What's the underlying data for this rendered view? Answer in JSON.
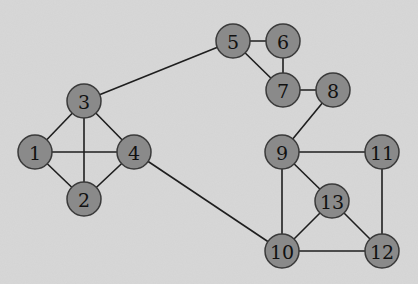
{
  "graph": {
    "title": "",
    "colors": {
      "background": "#d8d8d8",
      "node_fill": "#8a8a8a",
      "node_stroke": "#3a3a3a",
      "edge": "#1e1e1e",
      "label": "#111111"
    },
    "node_radius": 17,
    "nodes": [
      {
        "id": "1",
        "label": "1",
        "x": 35,
        "y": 152
      },
      {
        "id": "2",
        "label": "2",
        "x": 84,
        "y": 199
      },
      {
        "id": "3",
        "label": "3",
        "x": 84,
        "y": 101
      },
      {
        "id": "4",
        "label": "4",
        "x": 134,
        "y": 152
      },
      {
        "id": "5",
        "label": "5",
        "x": 233,
        "y": 41
      },
      {
        "id": "6",
        "label": "6",
        "x": 283,
        "y": 41
      },
      {
        "id": "7",
        "label": "7",
        "x": 283,
        "y": 90
      },
      {
        "id": "8",
        "label": "8",
        "x": 333,
        "y": 90
      },
      {
        "id": "9",
        "label": "9",
        "x": 282,
        "y": 152
      },
      {
        "id": "10",
        "label": "10",
        "x": 282,
        "y": 251
      },
      {
        "id": "11",
        "label": "11",
        "x": 382,
        "y": 152
      },
      {
        "id": "12",
        "label": "12",
        "x": 382,
        "y": 251
      },
      {
        "id": "13",
        "label": "13",
        "x": 332,
        "y": 201
      }
    ],
    "edges": [
      [
        "1",
        "2"
      ],
      [
        "1",
        "3"
      ],
      [
        "1",
        "4"
      ],
      [
        "2",
        "3"
      ],
      [
        "2",
        "4"
      ],
      [
        "3",
        "4"
      ],
      [
        "3",
        "5"
      ],
      [
        "4",
        "10"
      ],
      [
        "5",
        "6"
      ],
      [
        "5",
        "7"
      ],
      [
        "6",
        "7"
      ],
      [
        "7",
        "8"
      ],
      [
        "8",
        "9"
      ],
      [
        "9",
        "10"
      ],
      [
        "9",
        "11"
      ],
      [
        "9",
        "13"
      ],
      [
        "10",
        "12"
      ],
      [
        "10",
        "13"
      ],
      [
        "11",
        "12"
      ],
      [
        "12",
        "13"
      ]
    ]
  }
}
